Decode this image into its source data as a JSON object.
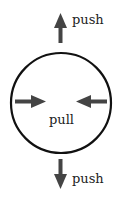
{
  "diagram": {
    "labels": {
      "top": "push",
      "center": "pull",
      "bottom": "push"
    },
    "colors": {
      "circle": "#111111",
      "arrow": "#444444",
      "text": "#222222"
    },
    "elements": [
      {
        "type": "circle",
        "description": "boundary circle"
      },
      {
        "type": "arrow",
        "direction": "up",
        "label": "push"
      },
      {
        "type": "arrow",
        "direction": "down",
        "label": "push"
      },
      {
        "type": "arrow",
        "direction": "right",
        "position": "left-inside"
      },
      {
        "type": "arrow",
        "direction": "left",
        "position": "right-inside"
      }
    ]
  }
}
